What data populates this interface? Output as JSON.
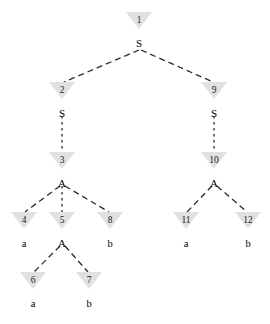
{
  "diagram": {
    "type": "parse-tree",
    "background_color": "#ffffff",
    "marker_color": "#dcdcdc",
    "edge_color": "#2b2b2b",
    "text_color": "#000000"
  },
  "nodes": [
    {
      "id": "n1",
      "number": "1",
      "label": "S",
      "x": 139,
      "y": 12,
      "label_y": 38,
      "kind": "nonterminal"
    },
    {
      "id": "n2",
      "number": "2",
      "label": "S",
      "x": 62,
      "y": 82,
      "label_y": 108,
      "kind": "nonterminal"
    },
    {
      "id": "n3",
      "number": "3",
      "label": "A",
      "x": 62,
      "y": 152,
      "label_y": 178,
      "kind": "nonterminal"
    },
    {
      "id": "n4",
      "number": "4",
      "label": "a",
      "x": 24,
      "y": 212,
      "label_y": 238,
      "kind": "terminal"
    },
    {
      "id": "n5",
      "number": "5",
      "label": "A",
      "x": 62,
      "y": 212,
      "label_y": 238,
      "kind": "nonterminal"
    },
    {
      "id": "n6",
      "number": "6",
      "label": "a",
      "x": 33,
      "y": 272,
      "label_y": 298,
      "kind": "terminal"
    },
    {
      "id": "n7",
      "number": "7",
      "label": "b",
      "x": 89,
      "y": 272,
      "label_y": 298,
      "kind": "terminal"
    },
    {
      "id": "n8",
      "number": "8",
      "label": "b",
      "x": 110,
      "y": 212,
      "label_y": 238,
      "kind": "terminal"
    },
    {
      "id": "n9",
      "number": "9",
      "label": "S",
      "x": 214,
      "y": 82,
      "label_y": 108,
      "kind": "nonterminal"
    },
    {
      "id": "n10",
      "number": "10",
      "label": "A",
      "x": 214,
      "y": 152,
      "label_y": 178,
      "kind": "nonterminal"
    },
    {
      "id": "n11",
      "number": "11",
      "label": "a",
      "x": 186,
      "y": 212,
      "label_y": 238,
      "kind": "terminal"
    },
    {
      "id": "n12",
      "number": "12",
      "label": "b",
      "x": 248,
      "y": 212,
      "label_y": 238,
      "kind": "terminal"
    }
  ],
  "edges": [
    {
      "from": "n1",
      "to": "n2",
      "style": "dashed",
      "x1": 139,
      "y1": 50,
      "x2": 64,
      "y2": 82
    },
    {
      "from": "n1",
      "to": "n9",
      "style": "dashed",
      "x1": 141,
      "y1": 50,
      "x2": 213,
      "y2": 82
    },
    {
      "from": "n2",
      "to": "n3",
      "style": "dashed-vert",
      "x1": 62,
      "y1": 116,
      "x2": 62,
      "y2": 152
    },
    {
      "from": "n3",
      "to": "n4",
      "style": "dashed",
      "x1": 60,
      "y1": 186,
      "x2": 25,
      "y2": 212
    },
    {
      "from": "n3",
      "to": "n5",
      "style": "dashed-vert",
      "x1": 62,
      "y1": 186,
      "x2": 62,
      "y2": 212
    },
    {
      "from": "n3",
      "to": "n8",
      "style": "dashed",
      "x1": 65,
      "y1": 186,
      "x2": 109,
      "y2": 212
    },
    {
      "from": "n5",
      "to": "n6",
      "style": "dashed",
      "x1": 60,
      "y1": 246,
      "x2": 34,
      "y2": 272
    },
    {
      "from": "n5",
      "to": "n7",
      "style": "dashed",
      "x1": 65,
      "y1": 246,
      "x2": 88,
      "y2": 272
    },
    {
      "from": "n9",
      "to": "n10",
      "style": "dashed-vert",
      "x1": 214,
      "y1": 116,
      "x2": 214,
      "y2": 152
    },
    {
      "from": "n10",
      "to": "n11",
      "style": "dashed",
      "x1": 212,
      "y1": 186,
      "x2": 187,
      "y2": 212
    },
    {
      "from": "n10",
      "to": "n12",
      "style": "dashed",
      "x1": 217,
      "y1": 186,
      "x2": 247,
      "y2": 212
    }
  ]
}
